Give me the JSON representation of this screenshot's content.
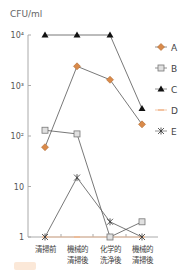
{
  "chart_data": {
    "type": "line",
    "title": "",
    "ylabel": "CFU/ml",
    "xlabel": "",
    "yscale": "log",
    "ylim": [
      1,
      10000
    ],
    "yticks": [
      {
        "value": 10000,
        "label": "10⁴"
      },
      {
        "value": 1000,
        "label": "10³"
      },
      {
        "value": 100,
        "label": "10²"
      },
      {
        "value": 10,
        "label": "10"
      },
      {
        "value": 1,
        "label": "1"
      }
    ],
    "categories": [
      [
        "清掃前"
      ],
      [
        "機械的",
        "清掃後"
      ],
      [
        "化学的",
        "洗浄後"
      ],
      [
        "機械的",
        "清掃後"
      ]
    ],
    "series": [
      {
        "name": "A",
        "marker": "diamond",
        "color": "#d98a4a",
        "line": "#555555",
        "values": [
          60,
          2400,
          1300,
          170
        ]
      },
      {
        "name": "B",
        "marker": "square",
        "color": "#bbbbbb",
        "line": "#555555",
        "values": [
          130,
          110,
          1,
          2
        ]
      },
      {
        "name": "C",
        "marker": "triangle",
        "color": "#111111",
        "line": "#555555",
        "values": [
          10000,
          10000,
          10000,
          350
        ]
      },
      {
        "name": "D",
        "marker": "dash",
        "color": "#f0b890",
        "line": "#f0b890",
        "values": [
          1,
          1,
          1,
          1
        ]
      },
      {
        "name": "E",
        "marker": "asterisk",
        "color": "#333333",
        "line": "#555555",
        "values": [
          1,
          15,
          2,
          1
        ]
      }
    ],
    "legend_position": "right",
    "grid": false
  }
}
